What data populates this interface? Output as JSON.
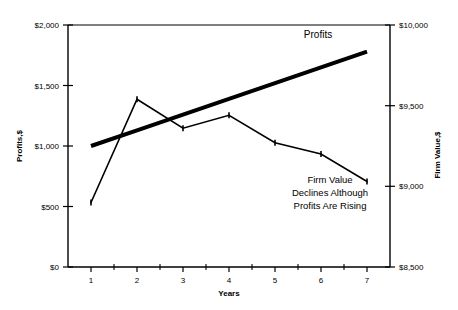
{
  "chart_data": {
    "type": "line",
    "title": "",
    "xlabel": "Years",
    "x": [
      1,
      2,
      3,
      4,
      5,
      6,
      7
    ],
    "categories": [
      "1",
      "2",
      "3",
      "4",
      "5",
      "6",
      "7"
    ],
    "xlim": [
      0.5,
      7.5
    ],
    "grid": false,
    "legend_position": "inline-annotation",
    "axes": {
      "left": {
        "label": "Profits,$",
        "ylim": [
          0,
          2000
        ],
        "ticks": [
          0,
          500,
          1000,
          1500,
          2000
        ],
        "tick_labels": [
          "$0",
          "$500",
          "$1,000",
          "$1,500",
          "$2,000"
        ]
      },
      "right": {
        "label": "Firm Value,$",
        "ylim": [
          8500,
          10000
        ],
        "ticks": [
          8500,
          9000,
          9500,
          10000
        ],
        "tick_labels": [
          "$8,500",
          "$9,000",
          "$9,500",
          "$10,000"
        ]
      }
    },
    "series": [
      {
        "name": "Profits",
        "axis": "left",
        "style": "thick",
        "line_width": 4,
        "color": "#000000",
        "markers": false,
        "values": [
          1000,
          1130,
          1260,
          1390,
          1520,
          1650,
          1780
        ]
      },
      {
        "name": "Firm Value",
        "axis": "right",
        "style": "thin",
        "line_width": 1.6,
        "color": "#000000",
        "markers": true,
        "values": [
          8900,
          9540,
          9360,
          9440,
          9270,
          9200,
          9030
        ]
      }
    ],
    "annotations": [
      {
        "name": "profits-series-label",
        "text": "Profits",
        "x_px": 318,
        "y_px": 35
      },
      {
        "name": "firm-value-note",
        "lines": [
          "Firm Value",
          "Declines Although",
          "Profits Are Rising"
        ],
        "x_px": 330,
        "y_px": 180
      }
    ]
  }
}
